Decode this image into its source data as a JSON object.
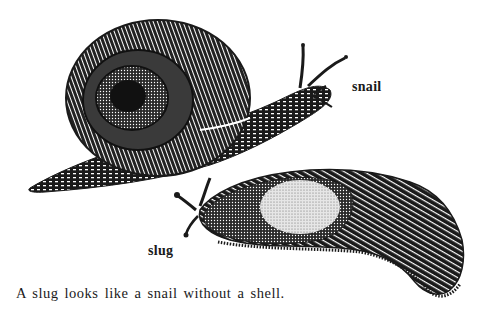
{
  "figure": {
    "labels": {
      "snail": "snail",
      "slug": "slug"
    },
    "caption": "A slug looks like a snail without a shell.",
    "subjects": [
      "snail-illustration",
      "slug-illustration"
    ],
    "colors": {
      "ink": "#1a1a1a",
      "paper": "#ffffff"
    }
  }
}
